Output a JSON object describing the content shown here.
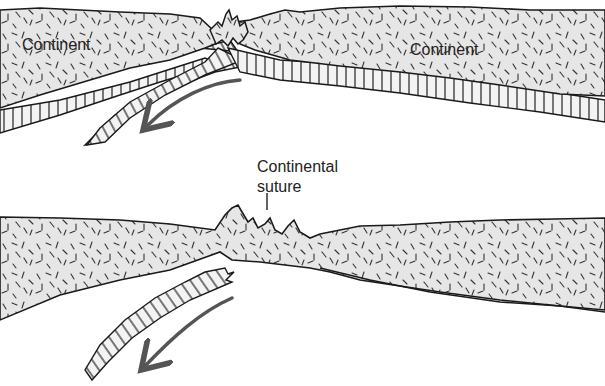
{
  "diagram": {
    "top_panel": {
      "label_left": "Continent",
      "label_right": "Continent"
    },
    "bottom_panel": {
      "suture_label_line1": "Continental",
      "suture_label_line2": "suture"
    },
    "colors": {
      "crust_fill": "#e6e6e6",
      "outline": "#1a1a1a",
      "arrow": "#555555",
      "background": "#ffffff"
    }
  }
}
